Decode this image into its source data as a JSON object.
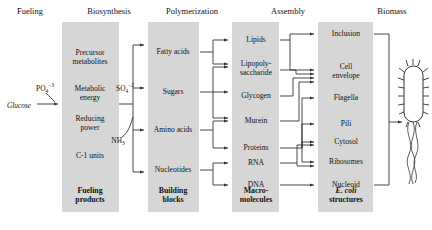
{
  "diagram": {
    "headers": [
      {
        "label": "Fueling"
      },
      {
        "label": "Biosynthesis"
      },
      {
        "label": "Polymerization"
      },
      {
        "label": "Assembly"
      },
      {
        "label": "Biomass"
      }
    ],
    "inputs": {
      "glucose": "Glucose",
      "phosphate": "PO",
      "phosphate_sub": "4",
      "phosphate_sup": "−3",
      "sulfate": "SO",
      "sulfate_sub": "4",
      "sulfate_sup": "−2",
      "ammonia": "NH",
      "ammonia_sub": "3"
    },
    "columns": [
      {
        "name": "fueling",
        "footer": "Fueling products",
        "footer_line1": "Fueling",
        "footer_line2": "products",
        "items": [
          {
            "label": "Precursor metabolites",
            "line1": "Precursor",
            "line2": "metabolites"
          },
          {
            "label": "Metabolic energy",
            "line1": "Metabolic",
            "line2": "energy"
          },
          {
            "label": "Reducing power",
            "line1": "Reducing",
            "line2": "power"
          },
          {
            "label": "C-1 units",
            "line1": "C-1 units",
            "line2": ""
          }
        ]
      },
      {
        "name": "biosynthesis",
        "footer": "Building blocks",
        "footer_line1": "Building",
        "footer_line2": "blocks",
        "items": [
          {
            "label": "Fatty acids"
          },
          {
            "label": "Sugars"
          },
          {
            "label": "Amino acids"
          },
          {
            "label": "Nucleotides"
          }
        ]
      },
      {
        "name": "polymerization",
        "footer": "Macromolecules",
        "footer_line1": "Macro-",
        "footer_line2": "molecules",
        "items": [
          {
            "label": "Lipids"
          },
          {
            "label": "Lipopolysaccharide",
            "line1": "Lipopoly-",
            "line2": "saccharide"
          },
          {
            "label": "Glycogen"
          },
          {
            "label": "Murein"
          },
          {
            "label": "Proteins"
          },
          {
            "label": "RNA"
          },
          {
            "label": "DNA"
          }
        ]
      },
      {
        "name": "assembly",
        "footer": "E. coli structures",
        "footer_line1": "E. coli",
        "footer_line2": "structures",
        "items": [
          {
            "label": "Inclusion"
          },
          {
            "label": "Cell envelope",
            "line1": "Cell",
            "line2": "envelope"
          },
          {
            "label": "Flagella"
          },
          {
            "label": "Pili"
          },
          {
            "label": "Cytosol"
          },
          {
            "label": "Ribosomes"
          },
          {
            "label": "Nucleoid"
          }
        ]
      },
      {
        "name": "biomass",
        "footer": "",
        "items": [
          {
            "label": "E. coli cell"
          }
        ]
      }
    ],
    "colors": {
      "box_fill": "#d6d6d6",
      "line": "#333333",
      "text": "#111111",
      "background": "#ffffff"
    }
  }
}
